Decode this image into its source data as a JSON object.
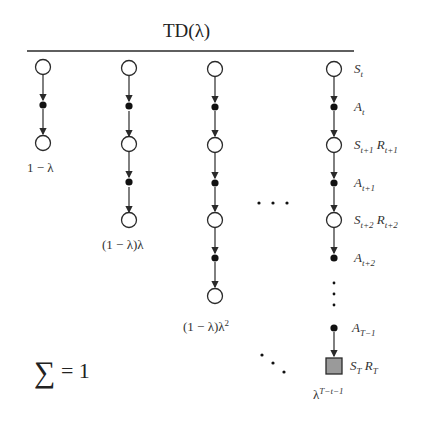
{
  "title": "TD(λ)",
  "summation_label": "∑ = 1",
  "columns": [
    {
      "weight": "1 − λ"
    },
    {
      "weight": "(1 − λ)λ"
    },
    {
      "weight": "(1 − λ)λ²"
    },
    {
      "weight": "λ^(T−t−1)"
    }
  ],
  "state_labels": {
    "s_t": "S_t",
    "a_t": "A_t",
    "s_t1": "S_{t+1} R_{t+1}",
    "a_t1": "A_{t+1}",
    "s_t2": "S_{t+2} R_{t+2}",
    "a_t2": "A_{t+2}",
    "a_T1": "A_{T−1}",
    "s_T": "S_T R_T"
  },
  "ellipsis": {
    "horizontal": "· · ·",
    "vertical": "⋮",
    "diagonal": "⋱"
  },
  "colors": {
    "line": "#2a2a2a",
    "state_fill": "#ffffff",
    "action_fill": "#111111",
    "terminal_fill": "#9a9a9a"
  }
}
